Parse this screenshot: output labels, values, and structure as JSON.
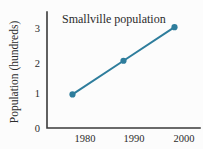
{
  "chart_data": {
    "type": "line",
    "title": "Smallville population",
    "xlabel": "",
    "ylabel": "Population (hundreds)",
    "x": [
      1980,
      1990,
      2000
    ],
    "categories": [
      "1980",
      "1990",
      "2000"
    ],
    "values": [
      1,
      2,
      3
    ],
    "series": [
      {
        "name": "Smallville population",
        "values": [
          1,
          2,
          3
        ]
      }
    ],
    "xtick_labels": [
      "1980",
      "1990",
      "2000"
    ],
    "ytick_labels": [
      "0",
      "1",
      "2",
      "3"
    ],
    "ytick_values": [
      0,
      1,
      2,
      3
    ],
    "xlim": [
      1975,
      2005
    ],
    "ylim": [
      0,
      3.45
    ],
    "grid": false,
    "legend": false,
    "legend_position": "none",
    "marker": "circle",
    "colors": {
      "series": "#2e7d9c",
      "axis": "#3a3a3a",
      "text": "#2b2b2b",
      "background": "#fcfcfc"
    }
  }
}
